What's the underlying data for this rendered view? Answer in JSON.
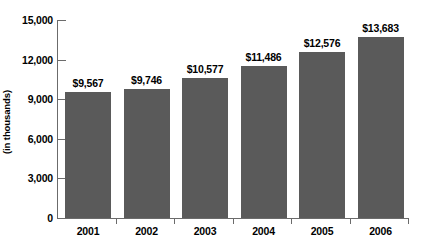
{
  "chart_data": {
    "type": "bar",
    "title": "",
    "subtitle": "",
    "xlabel": "",
    "ylabel": "(in thousands)",
    "categories": [
      "2001",
      "2002",
      "2003",
      "2004",
      "2005",
      "2006"
    ],
    "values": [
      9567,
      9746,
      10577,
      11486,
      12576,
      13683
    ],
    "data_labels": [
      "$9,567",
      "$9,746",
      "$10,577",
      "$11,486",
      "$12,576",
      "$13,683"
    ],
    "ylim": [
      0,
      15000
    ],
    "ytick_values": [
      0,
      3000,
      6000,
      9000,
      12000,
      15000
    ],
    "ytick_labels": [
      "0",
      "3,000",
      "6,000",
      "9,000",
      "12,000",
      "15,000"
    ],
    "grid": false,
    "legend": null,
    "legend_position": "none",
    "series": [
      {
        "name": "",
        "values": [
          9567,
          9746,
          10577,
          11486,
          12576,
          13683
        ],
        "color": "#5a5a5a"
      }
    ],
    "colors": {
      "bar_fill": "#5a5a5a",
      "axis_line": "#6b6b6b",
      "text": "#000000",
      "background": "#ffffff"
    }
  }
}
